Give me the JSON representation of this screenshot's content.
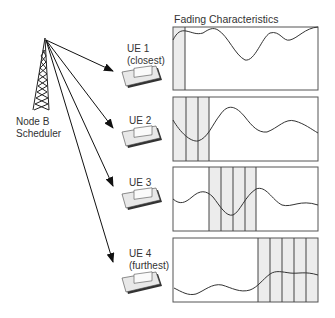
{
  "diagram": {
    "title": "Fading Characteristics",
    "base_station": {
      "label_line1": "Node B",
      "label_line2": "Scheduler",
      "icon": "cell-tower-icon"
    },
    "ues": [
      {
        "name": "UE 1",
        "sub": "(closest)",
        "icon": "data-card-icon"
      },
      {
        "name": "UE 2",
        "sub": "",
        "icon": "data-card-icon"
      },
      {
        "name": "UE 3",
        "sub": "",
        "icon": "data-card-icon"
      },
      {
        "name": "UE 4",
        "sub": "(furthest)",
        "icon": "data-card-icon"
      }
    ],
    "fading_panels": [
      {
        "ue": "UE 1",
        "scheduled_slots": 1
      },
      {
        "ue": "UE 2",
        "scheduled_slots": 3
      },
      {
        "ue": "UE 3",
        "scheduled_slots": 4
      },
      {
        "ue": "UE 4",
        "scheduled_slots": 5
      }
    ],
    "colors": {
      "line": "#333333",
      "shade": "#ececec",
      "border": "#555555"
    }
  }
}
